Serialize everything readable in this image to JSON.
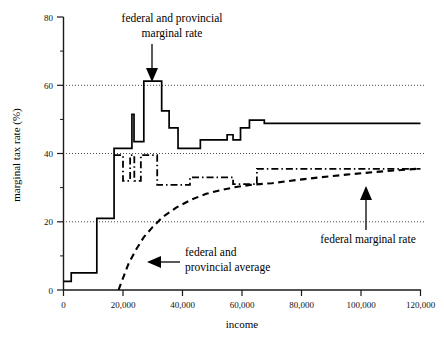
{
  "chart_data": {
    "type": "line",
    "title": "",
    "xlabel": "income",
    "ylabel": "marginal tax rate (%)",
    "xlim": [
      0,
      120000
    ],
    "ylim": [
      0,
      80
    ],
    "grid": true,
    "gridlines_y": [
      20,
      40,
      60
    ],
    "legend_position": "none",
    "x_ticks": [
      0,
      20000,
      40000,
      60000,
      80000,
      100000,
      120000
    ],
    "x_tick_labels": [
      "0",
      "20,000",
      "40,000",
      "60,000",
      "80,000",
      "100,000",
      "120,000"
    ],
    "y_ticks": [
      0,
      20,
      40,
      60,
      80
    ],
    "y_tick_labels": [
      "0",
      "20",
      "40",
      "60",
      "80"
    ],
    "y_minor_ticks": [
      10,
      30,
      50,
      70
    ],
    "series": [
      {
        "name": "federal and provincial marginal rate",
        "style": "solid",
        "points": [
          [
            0,
            2.5
          ],
          [
            2600,
            2.5
          ],
          [
            2600,
            5.0
          ],
          [
            11200,
            5.0
          ],
          [
            11200,
            21.0
          ],
          [
            17000,
            21.0
          ],
          [
            17000,
            41.5
          ],
          [
            23000,
            41.5
          ],
          [
            23000,
            51.5
          ],
          [
            23700,
            51.5
          ],
          [
            23700,
            43.5
          ],
          [
            27000,
            43.5
          ],
          [
            27000,
            61.2
          ],
          [
            33000,
            61.2
          ],
          [
            33000,
            52.5
          ],
          [
            35500,
            52.5
          ],
          [
            35500,
            47.5
          ],
          [
            38500,
            47.5
          ],
          [
            38500,
            41.5
          ],
          [
            46000,
            41.5
          ],
          [
            46000,
            44.0
          ],
          [
            55000,
            44.0
          ],
          [
            55000,
            45.5
          ],
          [
            57000,
            45.5
          ],
          [
            57000,
            44.0
          ],
          [
            59500,
            44.0
          ],
          [
            59500,
            47.5
          ],
          [
            62500,
            47.5
          ],
          [
            62500,
            49.8
          ],
          [
            67500,
            49.8
          ],
          [
            67500,
            48.8
          ],
          [
            120000,
            48.8
          ]
        ]
      },
      {
        "name": "federal marginal rate",
        "style": "dash-dot",
        "points": [
          [
            17000,
            39.5
          ],
          [
            20000,
            39.5
          ],
          [
            20000,
            32.0
          ],
          [
            22400,
            32.0
          ],
          [
            22400,
            39.5
          ],
          [
            23800,
            39.5
          ],
          [
            23800,
            32.0
          ],
          [
            26000,
            32.0
          ],
          [
            26000,
            39.5
          ],
          [
            31500,
            39.5
          ],
          [
            31500,
            30.8
          ],
          [
            42500,
            30.8
          ],
          [
            42500,
            33.0
          ],
          [
            57000,
            33.0
          ],
          [
            57000,
            31.0
          ],
          [
            65000,
            31.0
          ],
          [
            65000,
            35.5
          ],
          [
            120000,
            35.5
          ]
        ]
      },
      {
        "name": "federal and provincial average",
        "style": "dashed",
        "points": [
          [
            18500,
            0
          ],
          [
            20000,
            3.5
          ],
          [
            22000,
            8.0
          ],
          [
            24500,
            12.0
          ],
          [
            27000,
            15.5
          ],
          [
            30000,
            18.5
          ],
          [
            33500,
            21.5
          ],
          [
            38000,
            24.2
          ],
          [
            43000,
            26.5
          ],
          [
            48000,
            28.2
          ],
          [
            53000,
            29.3
          ],
          [
            58000,
            30.2
          ],
          [
            64000,
            30.9
          ],
          [
            70000,
            31.3
          ],
          [
            78000,
            32.2
          ],
          [
            86000,
            33.0
          ],
          [
            95000,
            33.8
          ],
          [
            105000,
            34.6
          ],
          [
            120000,
            35.6
          ]
        ]
      }
    ],
    "annotations": [
      {
        "id": "annot-marginal",
        "text_line1": "federal and provincial",
        "text_line2": "marginal rate",
        "arrow": "down",
        "target_value": [
          29500,
          62
        ]
      },
      {
        "id": "annot-federal-marginal",
        "text_line1": "federal marginal rate",
        "text_line2": "",
        "arrow": "up",
        "target_value": [
          95000,
          32
        ]
      },
      {
        "id": "annot-average",
        "text_line1": "federal and",
        "text_line2": "provincial average",
        "arrow": "left",
        "target_value": [
          34000,
          17
        ]
      }
    ]
  },
  "colors": {
    "background": "#ffffff",
    "ink": "#000000",
    "grid": "#333333"
  }
}
